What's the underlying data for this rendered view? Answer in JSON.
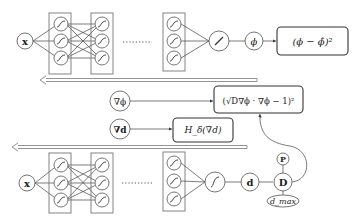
{
  "diagram": {
    "top_network": {
      "input_label": "x",
      "ellipsis": "........",
      "linear_node_label": "/",
      "output_label": "ϕ",
      "loss_box": "(ϕ − ϕ̂)²"
    },
    "middle": {
      "grad_phi_label": "∇ϕ",
      "eikonal_box": "(√D∇ϕ · ∇ϕ − 1)²",
      "grad_d_label": "∇d",
      "heaviside_box": "H_δ(∇d)"
    },
    "bottom_network": {
      "input_label": "x",
      "ellipsis": "........",
      "activation_node_label": "∫",
      "output_label": "d",
      "P_label": "P",
      "D_label": "D",
      "dmax_label": "d_max"
    },
    "arrows": [
      {
        "name": "backprop-top",
        "direction": "left"
      },
      {
        "name": "backprop-bottom",
        "direction": "left"
      }
    ],
    "colors": {
      "stroke": "#333333",
      "layer_box": "#777777",
      "arrow": "#888888",
      "background": "#ffffff"
    }
  }
}
